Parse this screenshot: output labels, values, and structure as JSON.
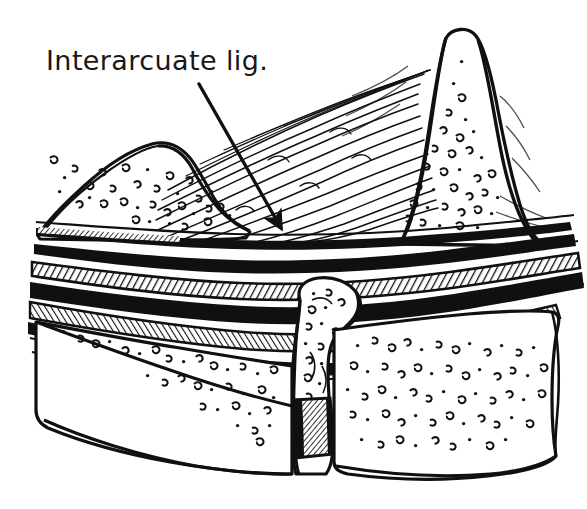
{
  "figure": {
    "type": "anatomical-line-illustration",
    "background_color": "#ffffff",
    "ink_color": "#101010",
    "width": 587,
    "height": 509
  },
  "annotations": [
    {
      "id": "interarcuate-ligament",
      "label": "Interarcuate lig.",
      "label_x": 46,
      "label_y": 47,
      "font_size": 27,
      "leader": {
        "from_x": 199,
        "from_y": 84,
        "to_x": 284,
        "to_y": 234,
        "has_arrowhead": true
      }
    }
  ],
  "structures": [
    {
      "id": "left-vertebral-arch",
      "name": "Left vertebral arch (lamina)",
      "has_trabecular_stipple": true
    },
    {
      "id": "right-spinous-process",
      "name": "Right spinous process / vertebral arch",
      "has_trabecular_stipple": true
    },
    {
      "id": "interarcuate-ligament-fibers",
      "name": "Interarcuate ligament fibers",
      "has_trabecular_stipple": false
    },
    {
      "id": "dural-ligament-bands",
      "name": "Layered dural and ligamentous bands",
      "has_trabecular_stipple": false
    },
    {
      "id": "articular-process-column",
      "name": "Articular process column",
      "has_trabecular_stipple": true
    },
    {
      "id": "lower-left-vertebral-body",
      "name": "Lower left vertebral body",
      "has_trabecular_stipple": true
    },
    {
      "id": "lower-right-vertebral-body",
      "name": "Lower right vertebral body",
      "has_trabecular_stipple": true
    },
    {
      "id": "intervertebral-hatched-region",
      "name": "Dark hatched intervertebral region",
      "has_trabecular_stipple": false
    }
  ]
}
